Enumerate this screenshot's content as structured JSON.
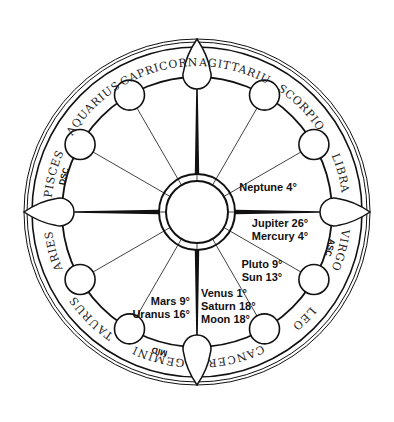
{
  "chart_title": "",
  "geometry": {
    "cx": 197,
    "cy": 212,
    "outer_r1": 173,
    "outer_r2": 170,
    "outer_r3": 165,
    "house_ring_r": 135,
    "hub_outer_r": 38,
    "hub_inner_r": 31,
    "house_circle_r": 15,
    "stroke_color": "#111111"
  },
  "signs": [
    {
      "name": "CAPRICORN",
      "angle": 105
    },
    {
      "name": "SAGITTARIUS",
      "angle": 75
    },
    {
      "name": "SCORPIO",
      "angle": 45
    },
    {
      "name": "LIBRA",
      "angle": 15
    },
    {
      "name": "VIRGO",
      "angle": -15
    },
    {
      "name": "LEO",
      "angle": -45
    },
    {
      "name": "CANCER",
      "angle": -75
    },
    {
      "name": "GEMINI",
      "angle": -105
    },
    {
      "name": "TAURUS",
      "angle": -135
    },
    {
      "name": "ARIES",
      "angle": -165
    },
    {
      "name": "PISCES",
      "angle": 165
    },
    {
      "name": "AQUARIUS",
      "angle": 135
    }
  ],
  "angles": [
    {
      "label": "DSC",
      "angle": 165
    },
    {
      "label": "ASC",
      "angle": -15
    },
    {
      "label": "MID",
      "angle": -105
    }
  ],
  "house_circle_angles": [
    120,
    150,
    60,
    30,
    -30,
    -60,
    -120,
    -150
  ],
  "cusp_angles": [
    90,
    0,
    -90,
    180
  ],
  "planets": [
    {
      "group": "house-2",
      "lines": [
        "Neptune 4°"
      ],
      "x": 268,
      "y": 191,
      "anchor": "middle"
    },
    {
      "group": "house-1",
      "lines": [
        "Jupiter 26°",
        "Mercury 4°"
      ],
      "x": 280,
      "y": 227,
      "anchor": "middle"
    },
    {
      "group": "house-12",
      "lines": [
        "Pluto 9°",
        "Sun 13°"
      ],
      "x": 262,
      "y": 268,
      "anchor": "middle"
    },
    {
      "group": "house-11",
      "lines": [
        "Venus 1°",
        "Saturn 18°",
        "Moon 18°"
      ],
      "x": 201,
      "y": 297,
      "anchor": "start"
    },
    {
      "group": "house-10",
      "lines": [
        "Mars 9°",
        "Uranus 16°"
      ],
      "x": 190,
      "y": 305,
      "anchor": "end"
    }
  ]
}
